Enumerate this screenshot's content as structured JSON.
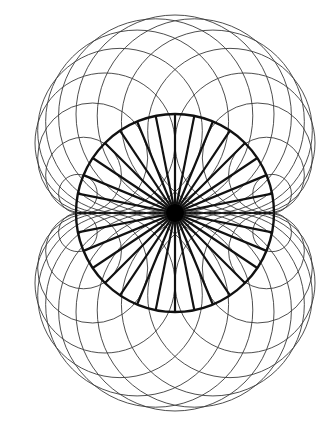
{
  "diagram": {
    "title": "",
    "type": "nephroid-circle-construction",
    "width": 328,
    "height": 439,
    "background": "#ffffff",
    "center": {
      "x": 175,
      "y": 213
    },
    "base_circle": {
      "radius": 99,
      "stroke": "#111111",
      "stroke_width": 2.4
    },
    "spokes": {
      "count": 32,
      "stroke": "#111111",
      "stroke_width": 2.2
    },
    "center_dot": {
      "radius": 9,
      "fill": "#000000"
    },
    "tangent_circles": {
      "count": 32,
      "description": "circles centered on the base circle, tangent to the horizontal diameter",
      "stroke": "#3a3a3a",
      "stroke_width": 0.9
    },
    "horizontal_axis": {
      "stroke": "#222222",
      "stroke_width": 2
    }
  }
}
